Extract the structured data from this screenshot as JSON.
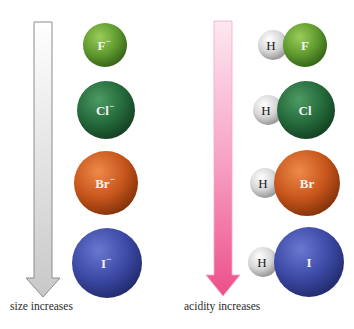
{
  "colors": {
    "F": "#5f9a2e",
    "Cl": "#256b3c",
    "Br": "#c8561c",
    "I": "#3d4aa6",
    "H": "#d6d6d6",
    "size_arrow": "#dcdcdc",
    "acidity_arrow": "#ee5f92"
  },
  "left_column": {
    "arrow_label": "size increases",
    "ions": [
      {
        "symbol": "F",
        "charge": "−",
        "label": "F−"
      },
      {
        "symbol": "Cl",
        "charge": "−",
        "label": "Cl−"
      },
      {
        "symbol": "Br",
        "charge": "−",
        "label": "Br−"
      },
      {
        "symbol": "I",
        "charge": "−",
        "label": "I−"
      }
    ]
  },
  "right_column": {
    "arrow_label": "acidity increases",
    "molecules": [
      {
        "h": "H",
        "x": "F",
        "name": "HF"
      },
      {
        "h": "H",
        "x": "Cl",
        "name": "HCl"
      },
      {
        "h": "H",
        "x": "Br",
        "name": "HBr"
      },
      {
        "h": "H",
        "x": "I",
        "name": "HI"
      }
    ]
  }
}
